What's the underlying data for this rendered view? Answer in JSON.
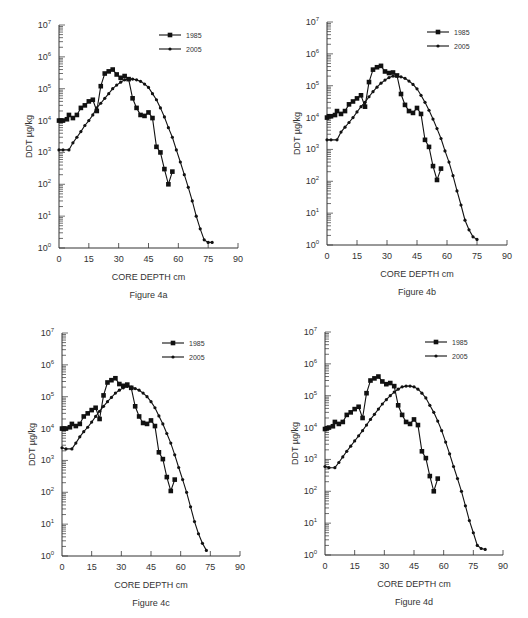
{
  "chart_data": [
    {
      "type": "line",
      "title": "Figure 4a",
      "xlabel": "CORE DEPTH cm",
      "ylabel": "DDT µg/kg",
      "yscale": "log",
      "xlim": [
        0,
        90
      ],
      "ylim": [
        1,
        10000000
      ],
      "xticks": [
        0,
        15,
        30,
        45,
        60,
        75,
        90
      ],
      "yticks": [
        "10^0",
        "10^1",
        "10^2",
        "10^3",
        "10^4",
        "10^5",
        "10^6",
        "10^7"
      ],
      "grid": false,
      "legend_position": "upper right",
      "axes_px": {
        "x0": 59,
        "x90": 238,
        "y_top": 25,
        "y_bottom": 248
      },
      "series": [
        {
          "name": "1985",
          "marker": "square",
          "x": [
            0,
            1,
            2,
            4,
            5,
            7,
            9,
            11,
            13,
            15,
            17,
            19,
            21,
            23,
            25,
            27,
            29,
            31,
            33,
            35,
            37,
            39,
            41,
            43,
            45,
            47,
            49,
            51,
            53,
            55,
            57
          ],
          "y": [
            10000,
            10000,
            10000,
            11000,
            15000,
            12000,
            15000,
            25000,
            30000,
            40000,
            45000,
            20000,
            120000,
            300000,
            350000,
            400000,
            280000,
            220000,
            250000,
            200000,
            50000,
            25000,
            15000,
            14000,
            18000,
            12000,
            1500,
            1000,
            300,
            100,
            250
          ]
        },
        {
          "name": "2005",
          "marker": "circle",
          "x": [
            0,
            2,
            5,
            7,
            9,
            11,
            13,
            15,
            17,
            19,
            21,
            23,
            25,
            27,
            29,
            31,
            33,
            35,
            37,
            39,
            41,
            43,
            45,
            47,
            49,
            51,
            53,
            55,
            57,
            59,
            61,
            63,
            65,
            67,
            69,
            71,
            73,
            75,
            77
          ],
          "y": [
            1200,
            1200,
            1200,
            2000,
            3000,
            4500,
            7000,
            10000,
            15000,
            25000,
            35000,
            50000,
            70000,
            100000,
            130000,
            160000,
            190000,
            200000,
            200000,
            190000,
            170000,
            140000,
            110000,
            70000,
            45000,
            25000,
            13000,
            6000,
            3000,
            1200,
            500,
            200,
            80,
            30,
            10,
            4,
            1.8,
            1.5,
            1.5
          ]
        }
      ]
    },
    {
      "type": "line",
      "title": "Figure 4b",
      "xlabel": "CORE DEPTH cm",
      "ylabel": "DDT µg/kg",
      "yscale": "log",
      "xlim": [
        0,
        90
      ],
      "ylim": [
        1,
        10000000
      ],
      "xticks": [
        0,
        15,
        30,
        45,
        60,
        75,
        90
      ],
      "yticks": [
        "10^0",
        "10^1",
        "10^2",
        "10^3",
        "10^4",
        "10^5",
        "10^6",
        "10^7"
      ],
      "grid": false,
      "legend_position": "upper right",
      "axes_px": {
        "x0": 327,
        "x90": 507,
        "y_top": 22,
        "y_bottom": 245
      },
      "series": [
        {
          "name": "1985",
          "marker": "square",
          "x": [
            0,
            1,
            2,
            4,
            5,
            7,
            9,
            11,
            13,
            15,
            17,
            19,
            21,
            23,
            25,
            27,
            29,
            31,
            33,
            35,
            37,
            39,
            41,
            43,
            45,
            47,
            49,
            51,
            53,
            55,
            57
          ],
          "y": [
            10000,
            11000,
            11000,
            12000,
            16000,
            13000,
            16000,
            26000,
            32000,
            40000,
            50000,
            22000,
            130000,
            320000,
            380000,
            420000,
            280000,
            250000,
            260000,
            210000,
            55000,
            25000,
            16000,
            14000,
            20000,
            13000,
            2000,
            1200,
            300,
            110,
            250
          ]
        },
        {
          "name": "2005",
          "marker": "circle",
          "x": [
            0,
            2,
            5,
            7,
            9,
            11,
            13,
            15,
            17,
            19,
            21,
            23,
            25,
            27,
            29,
            31,
            33,
            35,
            37,
            39,
            41,
            43,
            45,
            47,
            49,
            51,
            53,
            55,
            57,
            59,
            61,
            63,
            65,
            67,
            69,
            71,
            73,
            75
          ],
          "y": [
            2000,
            2000,
            2000,
            3500,
            5000,
            7000,
            10000,
            15000,
            22000,
            30000,
            45000,
            65000,
            90000,
            120000,
            150000,
            180000,
            200000,
            200000,
            190000,
            170000,
            140000,
            110000,
            80000,
            50000,
            30000,
            17000,
            9000,
            4500,
            2200,
            900,
            400,
            150,
            50,
            18,
            6,
            3,
            1.8,
            1.5
          ]
        }
      ]
    },
    {
      "type": "line",
      "title": "Figure 4c",
      "xlabel": "CORE DEPTH cm",
      "ylabel": "DDT µg/kg",
      "yscale": "log",
      "xlim": [
        0,
        90
      ],
      "ylim": [
        1,
        10000000
      ],
      "xticks": [
        0,
        15,
        30,
        45,
        60,
        75,
        90
      ],
      "yticks": [
        "10^0",
        "10^1",
        "10^2",
        "10^3",
        "10^4",
        "10^5",
        "10^6",
        "10^7"
      ],
      "grid": false,
      "legend_position": "upper right",
      "axes_px": {
        "x0": 62,
        "x90": 240,
        "y_top": 333,
        "y_bottom": 556
      },
      "series": [
        {
          "name": "1985",
          "marker": "square",
          "x": [
            0,
            1,
            2,
            4,
            5,
            7,
            9,
            11,
            13,
            15,
            17,
            19,
            21,
            23,
            25,
            27,
            29,
            31,
            33,
            35,
            37,
            39,
            41,
            43,
            45,
            47,
            49,
            51,
            53,
            55,
            57
          ],
          "y": [
            10000,
            10000,
            10000,
            11000,
            14000,
            12000,
            14000,
            24000,
            30000,
            38000,
            45000,
            20000,
            110000,
            280000,
            330000,
            380000,
            250000,
            220000,
            240000,
            190000,
            50000,
            24000,
            15000,
            14000,
            18000,
            12000,
            1800,
            1100,
            300,
            110,
            250
          ]
        },
        {
          "name": "2005",
          "marker": "circle",
          "x": [
            0,
            2,
            5,
            7,
            9,
            11,
            13,
            15,
            17,
            19,
            21,
            23,
            25,
            27,
            29,
            31,
            33,
            35,
            37,
            39,
            41,
            43,
            45,
            47,
            49,
            51,
            53,
            55,
            57,
            59,
            61,
            63,
            65,
            67,
            69,
            71,
            73
          ],
          "y": [
            2500,
            2300,
            2300,
            3500,
            5500,
            8000,
            11000,
            16000,
            24000,
            35000,
            50000,
            70000,
            95000,
            130000,
            160000,
            190000,
            210000,
            200000,
            180000,
            160000,
            130000,
            100000,
            70000,
            45000,
            25000,
            14000,
            7000,
            3500,
            1500,
            600,
            250,
            100,
            35,
            12,
            5,
            2.5,
            1.5
          ]
        }
      ]
    },
    {
      "type": "line",
      "title": "Figure 4d",
      "xlabel": "CORE DEPTH cm",
      "ylabel": "DDT µg/kg",
      "yscale": "log",
      "xlim": [
        0,
        90
      ],
      "ylim": [
        1,
        10000000
      ],
      "xticks": [
        0,
        15,
        30,
        45,
        60,
        75,
        90
      ],
      "yticks": [
        "10^0",
        "10^1",
        "10^2",
        "10^3",
        "10^4",
        "10^5",
        "10^6",
        "10^7"
      ],
      "grid": false,
      "legend_position": "upper right",
      "axes_px": {
        "x0": 325,
        "x90": 503,
        "y_top": 332,
        "y_bottom": 555
      },
      "series": [
        {
          "name": "1985",
          "marker": "square",
          "x": [
            0,
            1,
            2,
            4,
            5,
            7,
            9,
            11,
            13,
            15,
            17,
            19,
            21,
            23,
            25,
            27,
            29,
            31,
            33,
            35,
            37,
            39,
            41,
            43,
            45,
            47,
            49,
            51,
            53,
            55,
            57
          ],
          "y": [
            9000,
            9500,
            10000,
            11000,
            15000,
            13000,
            15000,
            25000,
            30000,
            38000,
            45000,
            20000,
            120000,
            300000,
            350000,
            400000,
            280000,
            230000,
            250000,
            200000,
            50000,
            25000,
            15000,
            13000,
            18000,
            12000,
            1800,
            1100,
            300,
            100,
            250
          ]
        },
        {
          "name": "2005",
          "marker": "circle",
          "x": [
            0,
            2,
            5,
            7,
            9,
            11,
            13,
            15,
            17,
            19,
            21,
            23,
            25,
            27,
            29,
            31,
            33,
            35,
            37,
            39,
            41,
            43,
            45,
            47,
            49,
            51,
            53,
            55,
            57,
            59,
            61,
            63,
            65,
            67,
            69,
            71,
            73,
            75,
            77,
            79,
            81
          ],
          "y": [
            600,
            550,
            550,
            800,
            1200,
            1800,
            2600,
            3800,
            5500,
            8000,
            12000,
            18000,
            26000,
            38000,
            55000,
            75000,
            100000,
            130000,
            160000,
            190000,
            200000,
            200000,
            190000,
            160000,
            120000,
            85000,
            50000,
            30000,
            16000,
            8000,
            3500,
            1500,
            600,
            250,
            100,
            35,
            12,
            5,
            2,
            1.6,
            1.5
          ]
        }
      ]
    }
  ],
  "figures": [
    {
      "caption": "Figure 4a",
      "xlabel": "CORE DEPTH cm",
      "ylabel": "DDT  µg/kg",
      "legend": [
        "1985",
        "2005"
      ]
    },
    {
      "caption": "Figure 4b",
      "xlabel": "CORE DEPTH cm",
      "ylabel": "DDT  µg/kg",
      "legend": [
        "1985",
        "2005"
      ]
    },
    {
      "caption": "Figure 4c",
      "xlabel": "CORE DEPTH cm",
      "ylabel": "DDT  µg/kg",
      "legend": [
        "1985",
        "2005"
      ]
    },
    {
      "caption": "Figure 4d",
      "xlabel": "CORE DEPTH cm",
      "ylabel": "DDT  µg/kg",
      "legend": [
        "1985",
        "2005"
      ]
    }
  ],
  "colors": {
    "line": "#111111",
    "axis": "#333333",
    "text": "#333333",
    "background": "#ffffff"
  }
}
